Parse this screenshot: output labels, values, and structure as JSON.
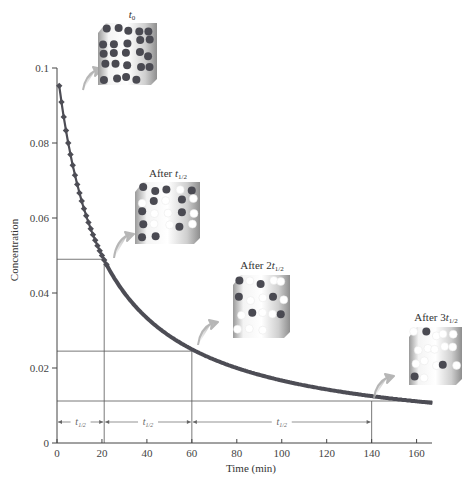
{
  "chart_data": {
    "type": "line",
    "title": "",
    "xlabel": "Time (min)",
    "ylabel": "Concentration",
    "xlim": [
      0,
      167
    ],
    "ylim": [
      0,
      0.1
    ],
    "x_ticks": [
      0,
      20,
      40,
      60,
      80,
      100,
      120,
      140,
      160
    ],
    "x_tick_labels": [
      "0",
      "20",
      "40",
      "60",
      "80",
      "100",
      "120",
      "140",
      "160"
    ],
    "y_ticks": [
      0,
      0.02,
      0.04,
      0.06,
      0.08,
      0.1
    ],
    "y_tick_labels": [
      "0",
      "0.02",
      "0.04",
      "0.06",
      "0.08",
      "0.1"
    ],
    "grid": false,
    "legend": null,
    "series": [
      {
        "name": "Concentration (second-order decay)",
        "model": "1/C = 1/C0 + k t",
        "C0": 0.1,
        "k": 0.5,
        "t_start": 1,
        "t_end": 167,
        "marker_points_t_max": 22,
        "color": "#4d4d55",
        "sample": [
          {
            "t": 1,
            "c": 0.0952
          },
          {
            "t": 10,
            "c": 0.0667
          },
          {
            "t": 20,
            "c": 0.05
          },
          {
            "t": 40,
            "c": 0.0333
          },
          {
            "t": 60,
            "c": 0.025
          },
          {
            "t": 80,
            "c": 0.02
          },
          {
            "t": 100,
            "c": 0.0167
          },
          {
            "t": 120,
            "c": 0.0143
          },
          {
            "t": 140,
            "c": 0.0125
          },
          {
            "t": 160,
            "c": 0.0111
          },
          {
            "t": 167,
            "c": 0.0107
          }
        ]
      }
    ],
    "half_life_guides": [
      {
        "t": 21,
        "c": 0.049
      },
      {
        "t": 60,
        "c": 0.0245
      },
      {
        "t": 140,
        "c": 0.0112
      }
    ],
    "half_life_intervals": [
      {
        "from": 0,
        "to": 21,
        "label": "t1/2"
      },
      {
        "from": 21,
        "to": 60,
        "label": "t1/2"
      },
      {
        "from": 60,
        "to": 140,
        "label": "t1/2"
      }
    ],
    "annotations": [
      {
        "label": "t0",
        "sub": "0",
        "base": "t",
        "prefix": ""
      },
      {
        "label": "After t1/2",
        "prefix": "After ",
        "base": "t",
        "sub": "1/2"
      },
      {
        "label": "After 2t1/2",
        "prefix": "After 2",
        "base": "t",
        "sub": "1/2"
      },
      {
        "label": "After 3t1/2",
        "prefix": "After 3",
        "base": "t",
        "sub": "1/2"
      }
    ]
  },
  "panels": [
    {
      "prefix": "",
      "base": "t",
      "sub": "0",
      "dark": 24,
      "light": 0
    },
    {
      "prefix": "After ",
      "base": "t",
      "sub": "1/2",
      "dark": 12,
      "light": 10
    },
    {
      "prefix": "After 2",
      "base": "t",
      "sub": "1/2",
      "dark": 6,
      "light": 12
    },
    {
      "prefix": "After 3",
      "base": "t",
      "sub": "1/2",
      "dark": 3,
      "light": 14
    }
  ]
}
